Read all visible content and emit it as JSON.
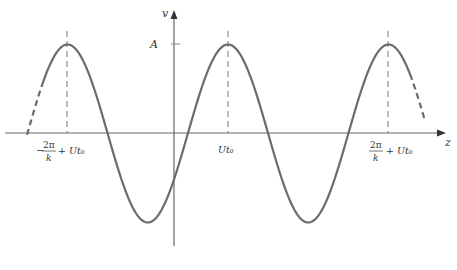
{
  "figure": {
    "type": "traveling-wave-plot",
    "axes": {
      "x_label": "z",
      "y_label": "v",
      "amplitude_label": "A"
    },
    "ticks": [
      {
        "id": "left",
        "numerator": "2π",
        "denominator": "k",
        "prefix": "−",
        "suffix": "+ Ut₀"
      },
      {
        "id": "center",
        "text": "Ut₀"
      },
      {
        "id": "right",
        "numerator": "2π",
        "denominator": "k",
        "prefix": "",
        "suffix": "+ Ut₀"
      }
    ],
    "curve": {
      "shape": "cosine",
      "peaks_at": [
        "−2π/k + Ut₀",
        "Ut₀",
        "2π/k + Ut₀"
      ],
      "amplitude": "A",
      "ends_dashed": true
    },
    "colors": {
      "curve": "#6b6b6b",
      "axis": "#555555",
      "dashed_guide": "#777777",
      "text": "#333333"
    }
  }
}
